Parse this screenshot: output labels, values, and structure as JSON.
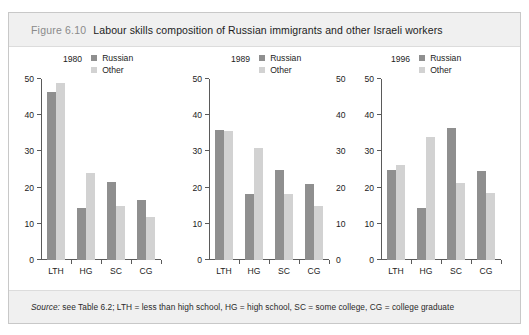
{
  "figure": {
    "number": "Figure 6.10",
    "title": "Labour skills composition of Russian immigrants and other Israeli workers",
    "source_prefix": "Source:",
    "source_rest": " see Table 6.2; LTH = less than high school, HG = high school, SC = some college, CG = college graduate"
  },
  "colors": {
    "russian": "#8f8f8f",
    "other": "#d2d2d2",
    "band": "#f0f0f0",
    "axis": "#5a5a5a",
    "frame_border": "#c8c8c8"
  },
  "legend": {
    "russian_label": "Russian",
    "other_label": "Other"
  },
  "chart_data": [
    {
      "type": "bar",
      "title": "1980",
      "xlabel": "",
      "ylabel": "",
      "ylim": [
        0,
        50
      ],
      "yticks": [
        0,
        10,
        20,
        30,
        40,
        50
      ],
      "ytick_labels": [
        "0",
        "10",
        "20",
        "30",
        "40",
        "50"
      ],
      "grid": false,
      "legend_position": "top-right",
      "categories": [
        "LTH",
        "HG",
        "SC",
        "CG"
      ],
      "series": [
        {
          "name": "Russian",
          "values": [
            46.5,
            14.3,
            21.5,
            16.7
          ]
        },
        {
          "name": "Other",
          "values": [
            49.0,
            24.0,
            15.0,
            12.0
          ]
        }
      ]
    },
    {
      "type": "bar",
      "title": "1989",
      "xlabel": "",
      "ylabel": "",
      "ylim": [
        0,
        50
      ],
      "yticks": [
        0,
        10,
        20,
        30,
        40,
        50
      ],
      "ytick_labels": [
        "0",
        "10",
        "20",
        "30",
        "40",
        "50"
      ],
      "grid": false,
      "legend_position": "top-right",
      "categories": [
        "LTH",
        "HG",
        "SC",
        "CG"
      ],
      "series": [
        {
          "name": "Russian",
          "values": [
            36.0,
            18.2,
            25.0,
            21.0
          ]
        },
        {
          "name": "Other",
          "values": [
            35.7,
            31.0,
            18.2,
            15.0
          ]
        }
      ]
    },
    {
      "type": "bar",
      "title": "1996",
      "xlabel": "",
      "ylabel": "",
      "ylim": [
        0,
        50
      ],
      "yticks": [
        0,
        10,
        20,
        30,
        40,
        50
      ],
      "ytick_labels": [
        "0",
        "10",
        "20",
        "30",
        "40",
        "50"
      ],
      "grid": false,
      "legend_position": "top-right",
      "categories": [
        "LTH",
        "HG",
        "SC",
        "CG"
      ],
      "series": [
        {
          "name": "Russian",
          "values": [
            25.0,
            14.3,
            36.5,
            24.5
          ]
        },
        {
          "name": "Other",
          "values": [
            26.2,
            34.0,
            21.2,
            18.5
          ]
        }
      ]
    }
  ]
}
